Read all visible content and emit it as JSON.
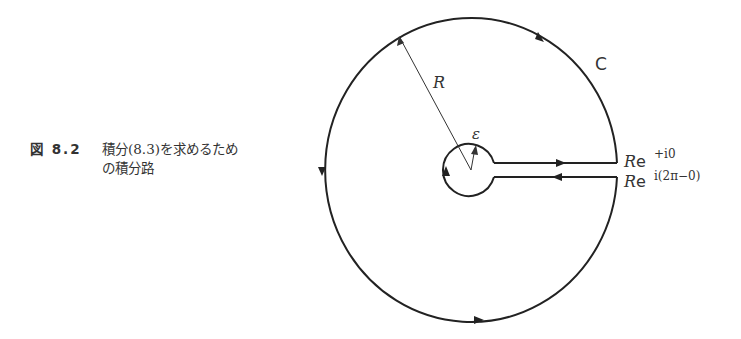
{
  "caption": {
    "number": "図 8.2",
    "line1": "積分(8.3)を求めるため",
    "line2": "の積分路"
  },
  "diagram": {
    "contour_label": "C",
    "radius_label": "R",
    "epsilon_label": "ε",
    "upper_endpoint_label": "Re",
    "upper_endpoint_exp": "+i0",
    "lower_endpoint_label": "Re",
    "lower_endpoint_exp": "i(2π−0)"
  }
}
